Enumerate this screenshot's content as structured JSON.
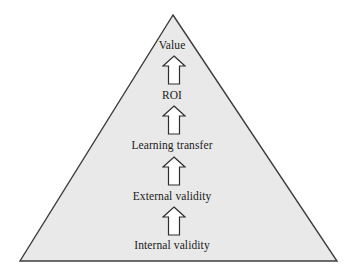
{
  "diagram": {
    "type": "pyramid-value-chain",
    "shape": {
      "name": "triangle",
      "fill_color": "#e9e9e9",
      "stroke_color": "#3d3d3d",
      "apex": {
        "x": 173,
        "y": 15
      },
      "base_left": {
        "x": 20,
        "y": 261
      },
      "base_right": {
        "x": 337,
        "y": 261
      }
    },
    "background_color": "#ffffff",
    "text_color": "#1a1a1a",
    "levels": [
      {
        "label": "Value"
      },
      {
        "label": "ROI"
      },
      {
        "label": "Learning transfer"
      },
      {
        "label": "External validity"
      },
      {
        "label": "Internal validity"
      }
    ],
    "arrows": [
      {
        "icon": "arrow-up-icon",
        "from": "ROI",
        "to": "Value"
      },
      {
        "icon": "arrow-up-icon",
        "from": "Learning transfer",
        "to": "ROI"
      },
      {
        "icon": "arrow-up-icon",
        "from": "External validity",
        "to": "Learning transfer"
      },
      {
        "icon": "arrow-up-icon",
        "from": "Internal validity",
        "to": "External validity"
      }
    ],
    "arrow_style": {
      "fill_color": "#ffffff",
      "stroke_color": "#2e2e2e"
    }
  }
}
